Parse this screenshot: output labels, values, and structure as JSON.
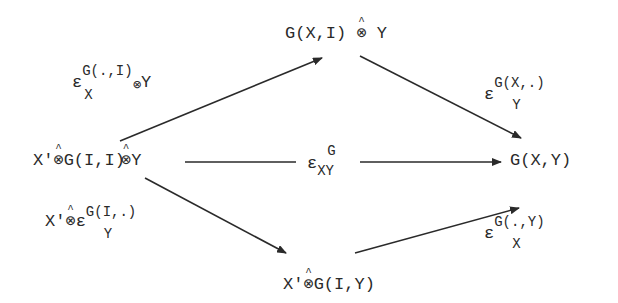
{
  "diagram": {
    "nodes": {
      "top": {
        "pre": "G(X,I) ",
        "op": "⊗",
        "post": " Y"
      },
      "left": {
        "p1": "X'",
        "op1": "⊗",
        "p2": "G(I,I)",
        "op2": "⊗",
        "p3": "Y"
      },
      "right": {
        "text": "G(X,Y)"
      },
      "bottom": {
        "p1": "X'",
        "op1": "⊗",
        "p2": "G(I,Y)"
      }
    },
    "labels": {
      "top_left": {
        "base": "ε",
        "sup": "G(.,I)",
        "sub": "X",
        "suffix_op": "⊗",
        "suffix": "Y"
      },
      "top_right": {
        "base": "ε",
        "sup": "G(X,.)",
        "sub": "Y"
      },
      "middle": {
        "base": "ε",
        "sup": "G",
        "sub": "XY"
      },
      "bottom_left": {
        "prefix": "X'",
        "prefix_op": "⊗",
        "base": "ε",
        "sup": "G(I,.)",
        "sub": "Y"
      },
      "bottom_right": {
        "base": "ε",
        "sup": "G(.,Y)",
        "sub": "X"
      }
    },
    "arrows": [
      {
        "from": "left",
        "to": "top",
        "label": "top_left"
      },
      {
        "from": "top",
        "to": "right",
        "label": "top_right"
      },
      {
        "from": "left",
        "to": "right",
        "label": "middle"
      },
      {
        "from": "left",
        "to": "bottom",
        "label": "bottom_left"
      },
      {
        "from": "bottom",
        "to": "right",
        "label": "bottom_right"
      }
    ],
    "colors": {
      "ink": "#2a2a2a",
      "background": "#ffffff"
    }
  }
}
